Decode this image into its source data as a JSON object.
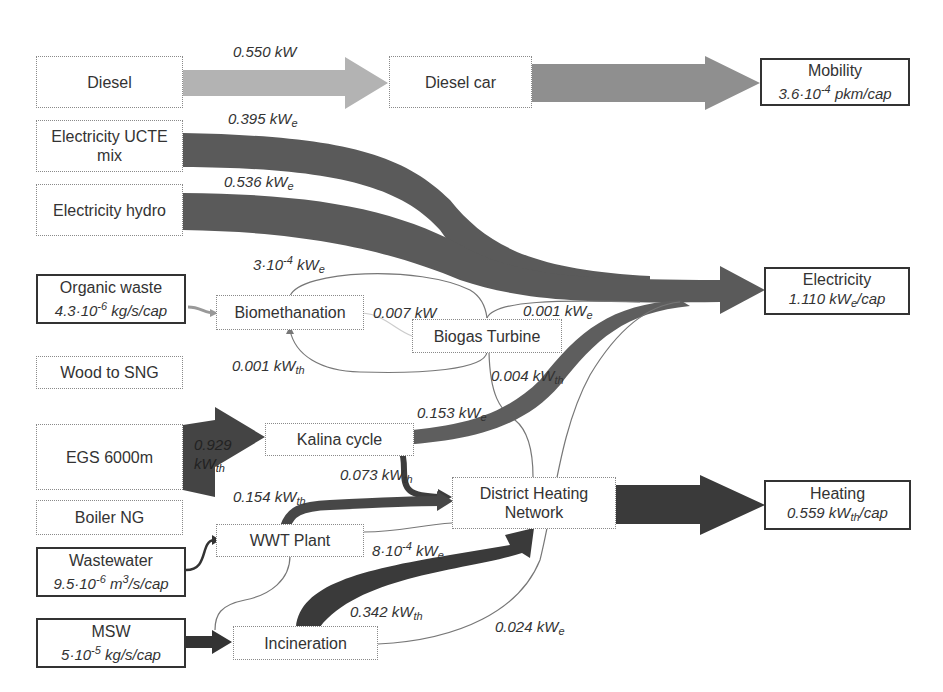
{
  "nodes": {
    "diesel": "Diesel",
    "diesel_car": "Diesel car",
    "mobility": {
      "title": "Mobility",
      "value": "3.6·10-4 pkm/cap"
    },
    "elec_ucte": "Electricity UCTE mix",
    "elec_hydro": "Electricity hydro",
    "organic_waste": {
      "title": "Organic waste",
      "value": "4.3·10-6 kg/s/cap"
    },
    "biomethanation": "Biomethanation",
    "biogas_turbine": "Biogas Turbine",
    "electricity": {
      "title": "Electricity",
      "value": "1.110 kWe/cap"
    },
    "wood_sng": "Wood to SNG",
    "egs": "EGS 6000m",
    "kalina": "Kalina cycle",
    "boiler_ng": "Boiler NG",
    "dhn": "District Heating Network",
    "heating": {
      "title": "Heating",
      "value": "0.559 kWth/cap"
    },
    "wastewater": {
      "title": "Wastewater",
      "value": "9.5·10-6 m3/s/cap"
    },
    "wwt": "WWT Plant",
    "msw": {
      "title": "MSW",
      "value": "5·10-5 kg/s/cap"
    },
    "incineration": "Incineration"
  },
  "flows": [
    {
      "from": "Diesel",
      "to": "Diesel car",
      "label": "0.550 kW"
    },
    {
      "from": "Diesel car",
      "to": "Mobility",
      "label": ""
    },
    {
      "from": "Electricity UCTE mix",
      "to": "Electricity",
      "label": "0.395 kWe"
    },
    {
      "from": "Electricity hydro",
      "to": "Electricity",
      "label": "0.536 kWe"
    },
    {
      "from": "Biogas Turbine",
      "to": "Biomethanation",
      "label": "3·10-4 kWe"
    },
    {
      "from": "Biomethanation",
      "to": "Biogas Turbine",
      "label": "0.007 kW"
    },
    {
      "from": "Biogas Turbine",
      "to": "Electricity",
      "label": "0.001 kWe"
    },
    {
      "from": "Biogas Turbine",
      "to": "Biomethanation",
      "label": "0.001 kWth"
    },
    {
      "from": "Biogas Turbine",
      "to": "District Heating Network",
      "label": "0.004 kWth"
    },
    {
      "from": "EGS 6000m",
      "to": "Kalina cycle",
      "label": "0.929 kWth"
    },
    {
      "from": "Kalina cycle",
      "to": "Electricity",
      "label": "0.153 kWe"
    },
    {
      "from": "Kalina cycle",
      "to": "District Heating Network",
      "label": "0.073 kWth"
    },
    {
      "from": "WWT Plant",
      "to": "District Heating Network",
      "label": "0.154 kWth"
    },
    {
      "from": "District Heating Network",
      "to": "WWT Plant",
      "label": "8·10-4 kWe"
    },
    {
      "from": "Incineration",
      "to": "District Heating Network",
      "label": "0.342 kWth"
    },
    {
      "from": "Incineration",
      "to": "Electricity",
      "label": "0.024 kWe"
    },
    {
      "from": "District Heating Network",
      "to": "Heating",
      "label": ""
    }
  ],
  "colors": {
    "light_flow": "#b3b3b3",
    "mid_flow": "#8f8f8f",
    "dark_flow": "#5a5a5a",
    "darkest_flow": "#444444",
    "thin_line": "#777777"
  }
}
